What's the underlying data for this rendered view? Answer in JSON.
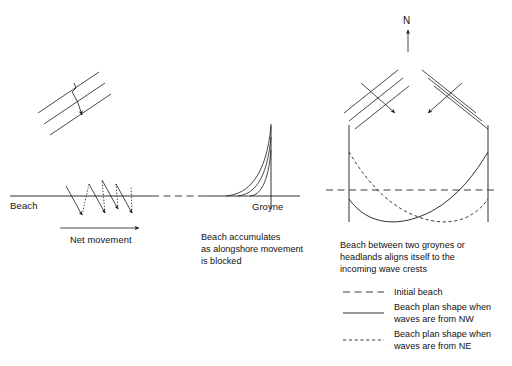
{
  "figure": {
    "title_labels": {
      "beach": "Beach",
      "net_movement": "Net movement",
      "groyne": "Groyne",
      "north": "N"
    },
    "captions": {
      "middle": [
        "Beach accumulates",
        "as alongshore movement",
        "is blocked"
      ],
      "right": [
        "Beach between two groynes or",
        "headlands aligns itself to the",
        "incoming wave crests"
      ]
    },
    "legend": [
      {
        "key": "initial-beach",
        "style": "long-dash",
        "lines": [
          "Initial beach"
        ]
      },
      {
        "key": "nw-waves",
        "style": "solid",
        "lines": [
          "Beach plan shape when",
          "waves are from NW"
        ]
      },
      {
        "key": "ne-waves",
        "style": "short-dash",
        "lines": [
          "Beach plan shape when",
          "waves are from NE"
        ]
      }
    ],
    "colors": {
      "ink": "#1a1a1a",
      "background": "#ffffff"
    }
  }
}
